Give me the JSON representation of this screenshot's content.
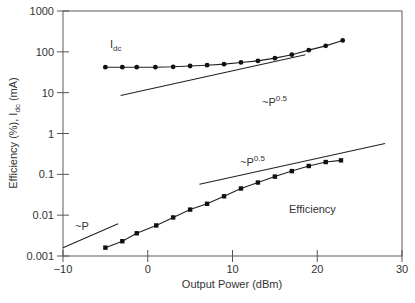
{
  "chart_data": {
    "type": "line",
    "title": "",
    "xlabel": "Output Power (dBm)",
    "ylabel": "Efficiency (%), I_dc (mA)",
    "xscale": "linear",
    "yscale": "log",
    "xlim": [
      -10,
      30
    ],
    "ylim": [
      0.001,
      1000
    ],
    "xticks": [
      "-10",
      "0",
      "10",
      "20",
      "30"
    ],
    "yticks": [
      "0.001",
      "0.01",
      "0.1",
      "1",
      "10",
      "100",
      "1000"
    ],
    "grid": false,
    "legend": null,
    "series": [
      {
        "name": "Idc",
        "marker": "circle",
        "x": [
          -5,
          -3,
          -1.3,
          0.9,
          3,
          5,
          7,
          9,
          11,
          13,
          15,
          17,
          19,
          21,
          23
        ],
        "y": [
          42,
          42,
          42,
          42,
          43,
          45,
          47,
          50,
          55,
          60,
          70,
          85,
          110,
          140,
          190
        ]
      },
      {
        "name": "Efficiency",
        "marker": "square",
        "x": [
          -5,
          -3,
          -1.3,
          1,
          3,
          5,
          7,
          9,
          11,
          13,
          15,
          17,
          19,
          21,
          22.8
        ],
        "y": [
          0.0016,
          0.0023,
          0.0036,
          0.0056,
          0.0088,
          0.0137,
          0.019,
          0.029,
          0.045,
          0.063,
          0.088,
          0.12,
          0.16,
          0.2,
          0.22
        ]
      }
    ],
    "reference_lines": [
      {
        "label": "~P^0.5",
        "near": "Idc",
        "x": [
          -3.2,
          18.6
        ],
        "y": [
          8.5,
          85
        ]
      },
      {
        "label": "~P^0.5",
        "near": "Efficiency",
        "x": [
          6.1,
          28
        ],
        "y": [
          0.057,
          0.57
        ]
      },
      {
        "label": "~P",
        "x": [
          -10,
          -3.5
        ],
        "y": [
          0.0016,
          0.0062
        ]
      }
    ],
    "annotations": [
      {
        "text": "Idc",
        "x": -5.5,
        "y": 100
      },
      {
        "text": "~P0.5",
        "x": 16,
        "y": 12
      },
      {
        "text": "~P0.5",
        "x": 9,
        "y": 0.2
      },
      {
        "text": "Efficiency",
        "x": 14.5,
        "y": 0.013
      },
      {
        "text": "~P",
        "x": -8.5,
        "y": 0.0045
      }
    ]
  },
  "labels": {
    "xlabel": "Output Power (dBm)",
    "ylabel_main": "Efficiency (%), I",
    "ylabel_sub": "dc",
    "ylabel_tail": " (mA)",
    "idc_main": "I",
    "idc_sub": "dc",
    "p05_a_prefix": "~P",
    "p05_a_exp": "0.5",
    "p05_b_prefix": "~P",
    "p05_b_exp": "0.5",
    "p_label": "~P",
    "eff_label": "Efficiency"
  }
}
